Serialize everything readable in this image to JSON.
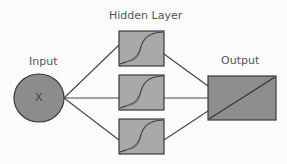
{
  "diagram": {
    "title_hidden": "Hidden Layer",
    "input_label": "Input",
    "input_symbol": "X",
    "output_label": "Output",
    "hidden_units": 3,
    "hidden_icon": "sigmoid-curve",
    "output_icon": "linear-diagonal",
    "colors": {
      "node_fill": "#8c8c8c",
      "box_fill": "#a9a9a9",
      "stroke": "#3a3a3a",
      "text": "#555555"
    }
  }
}
